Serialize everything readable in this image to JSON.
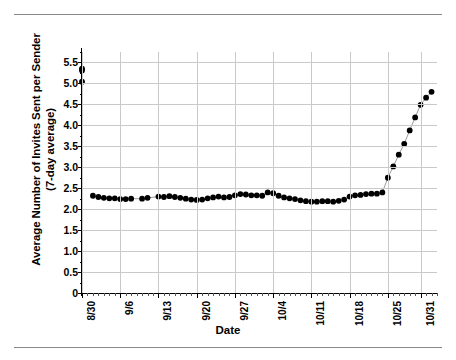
{
  "figure": {
    "xlabel": "Date",
    "ylabel_line1": "Average Number of Invites Sent per Sender",
    "ylabel_line2": "(7-day average)"
  },
  "chart_data": {
    "type": "line",
    "title": "",
    "xlabel": "Date",
    "ylabel": "Average Number of Invites Sent per Sender (7-day average)",
    "ylim": [
      0,
      5.75
    ],
    "ytick_labels": [
      "0",
      "0.5",
      "1.0",
      "1.5",
      "2.0",
      "2.5",
      "3.0",
      "3.5",
      "4.0",
      "4.5",
      "5.0",
      "5.5"
    ],
    "ytick_values": [
      0,
      0.5,
      1.0,
      1.5,
      2.0,
      2.5,
      3.0,
      3.5,
      4.0,
      4.5,
      5.0,
      5.5
    ],
    "xtick_labels": [
      "8/30",
      "9/6",
      "9/13",
      "9/20",
      "9/27",
      "10/4",
      "10/11",
      "10/18",
      "10/25",
      "10/31"
    ],
    "xtick_days": [
      0,
      7,
      14,
      21,
      28,
      35,
      42,
      49,
      56,
      62
    ],
    "x_range_days": [
      0,
      65
    ],
    "grid": true,
    "legend": "none",
    "marker": "filled-circle",
    "marker_color": "#000000",
    "line_color": "#9a9a9a",
    "series": [
      {
        "name": "Average invites sent per sender (7-day average)",
        "x_days": [
          2,
          3,
          4,
          5,
          6,
          7,
          8,
          9,
          11,
          12,
          14,
          15,
          16,
          17,
          18,
          19,
          20,
          21,
          22,
          23,
          24,
          25,
          26,
          27,
          28,
          29,
          30,
          31,
          32,
          33,
          34,
          35,
          36,
          37,
          38,
          39,
          40,
          41,
          42,
          43,
          44,
          45,
          46,
          47,
          48,
          49,
          50,
          51,
          52,
          53,
          54,
          55,
          56,
          57,
          58,
          59,
          60,
          61,
          62,
          63,
          64
        ],
        "x_labels": [
          "9/1",
          "9/2",
          "9/3",
          "9/4",
          "9/5",
          "9/6",
          "9/7",
          "9/8",
          "9/10",
          "9/11",
          "9/13",
          "9/14",
          "9/15",
          "9/16",
          "9/17",
          "9/18",
          "9/19",
          "9/20",
          "9/21",
          "9/22",
          "9/23",
          "9/24",
          "9/25",
          "9/26",
          "9/27",
          "9/28",
          "9/29",
          "9/30",
          "10/1",
          "10/2",
          "10/3",
          "10/4",
          "10/5",
          "10/6",
          "10/7",
          "10/8",
          "10/9",
          "10/10",
          "10/11",
          "10/12",
          "10/13",
          "10/14",
          "10/15",
          "10/16",
          "10/17",
          "10/18",
          "10/19",
          "10/20",
          "10/21",
          "10/22",
          "10/23",
          "10/24",
          "10/25",
          "10/26",
          "10/27",
          "10/28",
          "10/29",
          "10/30",
          "10/31",
          "11/1",
          "11/2"
        ],
        "values": [
          2.32,
          2.29,
          2.27,
          2.26,
          2.26,
          2.24,
          2.24,
          2.25,
          2.25,
          2.27,
          2.3,
          2.29,
          2.31,
          2.29,
          2.27,
          2.25,
          2.23,
          2.22,
          2.23,
          2.26,
          2.28,
          2.3,
          2.28,
          2.29,
          2.33,
          2.36,
          2.35,
          2.33,
          2.33,
          2.32,
          2.4,
          2.38,
          2.32,
          2.28,
          2.26,
          2.24,
          2.21,
          2.19,
          2.18,
          2.18,
          2.19,
          2.19,
          2.18,
          2.2,
          2.23,
          2.3,
          2.33,
          2.34,
          2.36,
          2.37,
          2.37,
          2.4,
          2.75,
          3.02,
          3.3,
          3.56,
          3.88,
          4.19,
          4.49,
          4.66,
          4.8,
          5.04,
          5.35,
          5.31
        ]
      }
    ]
  }
}
